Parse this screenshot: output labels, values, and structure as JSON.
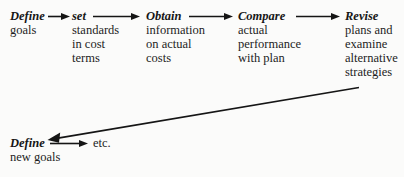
{
  "diagram": {
    "type": "flowchart",
    "orientation": "horizontal-cycle",
    "ink_color": "#151515",
    "background_color": "#fbfbfa",
    "stages": [
      {
        "id": "define-goals",
        "title": "Define",
        "desc_lines": [
          "goals"
        ]
      },
      {
        "id": "set-standards",
        "title": "set",
        "desc_lines": [
          "standards",
          "in cost",
          "terms"
        ]
      },
      {
        "id": "obtain-info",
        "title": "Obtain",
        "desc_lines": [
          "information",
          "on actual",
          "costs"
        ]
      },
      {
        "id": "compare",
        "title": "Compare",
        "desc_lines": [
          "actual",
          "performance",
          "with plan"
        ]
      },
      {
        "id": "revise",
        "title": "Revise",
        "desc_lines": [
          "plans and",
          "examine",
          "alternative",
          "strategies"
        ]
      },
      {
        "id": "define-new-goals",
        "title": "Define",
        "desc_lines": [
          "new goals"
        ]
      }
    ],
    "terminal_label": "etc.",
    "connectors": [
      {
        "id": "define-to-set",
        "from": "define-goals",
        "to": "set-standards",
        "style": "straight-right"
      },
      {
        "id": "set-to-obtain",
        "from": "set-standards",
        "to": "obtain-info",
        "style": "straight-right"
      },
      {
        "id": "obtain-to-compare",
        "from": "obtain-info",
        "to": "compare",
        "style": "straight-right"
      },
      {
        "id": "compare-to-revise",
        "from": "compare",
        "to": "revise",
        "style": "straight-right"
      },
      {
        "id": "revise-to-define-new",
        "from": "revise",
        "to": "define-new-goals",
        "style": "diagonal-feedback-left"
      },
      {
        "id": "define-new-to-etc",
        "from": "define-new-goals",
        "to": "etc.",
        "style": "straight-right"
      }
    ]
  }
}
